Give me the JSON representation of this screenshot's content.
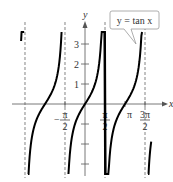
{
  "chart_data": {
    "type": "line",
    "title": "",
    "function_label": "y = tan x",
    "xlabel": "x",
    "ylabel": "y",
    "x_ticks": [
      {
        "value": -1.5708,
        "label_num": "π",
        "label_den": "2",
        "sign": "−"
      },
      {
        "value": 1.5708,
        "label_num": "π",
        "label_den": "2",
        "sign": ""
      },
      {
        "value": 3.1416,
        "label": "π"
      },
      {
        "value": 4.7124,
        "label_num": "3π",
        "label_den": "2",
        "sign": ""
      }
    ],
    "y_ticks": [
      -3,
      -2,
      -1,
      1,
      2,
      3
    ],
    "y_tick_labels": [
      "1",
      "2",
      "3"
    ],
    "asymptotes": [
      -4.7124,
      -1.5708,
      1.5708,
      4.7124
    ],
    "xlim": [
      -6.5,
      6.8
    ],
    "ylim": [
      -3.9,
      4.2
    ],
    "series": [
      {
        "name": "y = tan x",
        "function": "tan",
        "branches": [
          [
            -5.02,
            -4.78
          ],
          [
            -4.48,
            -1.84
          ],
          [
            -1.3,
            1.84
          ],
          [
            1.3,
            4.48
          ],
          [
            4.95,
            5.2
          ]
        ]
      }
    ],
    "grid": false
  }
}
